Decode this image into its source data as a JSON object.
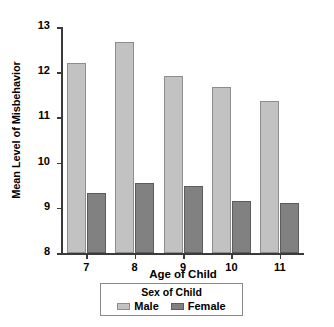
{
  "chart_data": {
    "type": "bar",
    "title": "",
    "xlabel": "Age of Child",
    "ylabel": "Mean Level of Misbehavior",
    "categories": [
      "7",
      "8",
      "9",
      "10",
      "11"
    ],
    "series": [
      {
        "name": "Male",
        "color": "#c2c2c2",
        "values": [
          12.2,
          12.67,
          11.92,
          11.68,
          11.37
        ]
      },
      {
        "name": "Female",
        "color": "#818181",
        "values": [
          9.32,
          9.56,
          9.49,
          9.14,
          9.11
        ]
      }
    ],
    "ylim": [
      8,
      13
    ],
    "yticks": [
      "8",
      "9",
      "10",
      "11",
      "12",
      "13"
    ],
    "grid": false,
    "legend": {
      "title": "Sex of Child",
      "position": "bottom",
      "entries": [
        "Male",
        "Female"
      ]
    }
  }
}
